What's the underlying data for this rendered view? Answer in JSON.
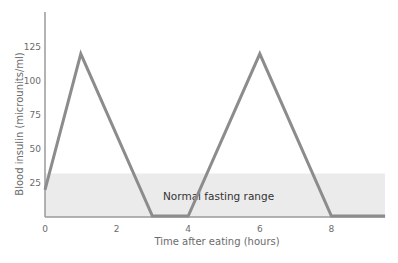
{
  "chart_data": {
    "type": "line",
    "title": "",
    "xlabel": "Time after eating (hours)",
    "ylabel": "Blood insulin (microunits/ml)",
    "x_ticks": [
      0,
      2,
      4,
      6,
      8
    ],
    "y_ticks": [
      25,
      50,
      75,
      100,
      125
    ],
    "xlim": [
      0,
      9.6
    ],
    "ylim": [
      0,
      150
    ],
    "grid": false,
    "legend": null,
    "series": [
      {
        "name": "Blood insulin",
        "x": [
          0,
          1,
          3,
          4,
          6,
          8,
          9.5
        ],
        "y": [
          20,
          120,
          0,
          0,
          120,
          0,
          0
        ]
      }
    ],
    "annotations": [
      {
        "type": "band",
        "label": "Normal fasting range",
        "y_from": 0,
        "y_to": 32
      }
    ],
    "colors": {
      "line": "#8c8c8c",
      "band": "#ebebeb",
      "axis": "#9a9a9a"
    }
  },
  "labels": {
    "xlabel": "Time after eating (hours)",
    "ylabel": "Blood insulin (microunits/ml)",
    "band": "Normal fasting range",
    "x_ticks": [
      "0",
      "2",
      "4",
      "6",
      "8"
    ],
    "y_ticks": [
      "25",
      "50",
      "75",
      "100",
      "125"
    ]
  }
}
